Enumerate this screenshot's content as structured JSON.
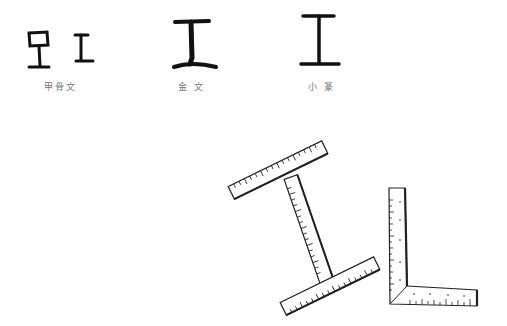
{
  "figure": {
    "scripts": [
      {
        "label": "甲骨文",
        "variants": 2
      },
      {
        "label": "金 文",
        "variants": 1
      },
      {
        "label": "小 篆",
        "variants": 1
      }
    ],
    "illustrations": [
      {
        "name": "i-shaped-ruler",
        "description": "two T-squares forming an I shape"
      },
      {
        "name": "l-shaped-ruler",
        "description": "carpenter's square"
      }
    ],
    "colors": {
      "ink": "#111111",
      "label": "#777777",
      "background": "#ffffff"
    }
  }
}
